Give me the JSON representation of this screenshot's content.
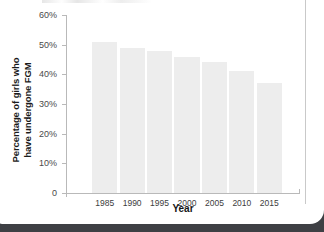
{
  "figure": {
    "card_background": "#ffffff",
    "page_background": "#3e4044",
    "bar_color": "#ededed",
    "axis_color": "#b9b9b9",
    "text_color": "#1b1b1b"
  },
  "chart_data": {
    "type": "bar",
    "title": "",
    "subtitle": "",
    "xlabel": "Year",
    "ylabel": "Percentage of girls who have undergone FGM",
    "ylabel_lines": [
      "Percentage of girls who",
      "have undergone FGM"
    ],
    "categories": [
      "1985",
      "1990",
      "1995",
      "2000",
      "2005",
      "2010",
      "2015"
    ],
    "values": [
      51,
      49,
      48,
      46,
      44,
      41,
      37
    ],
    "ylim": [
      0,
      60
    ],
    "ytick_values": [
      0,
      10,
      20,
      30,
      40,
      50,
      60
    ],
    "ytick_labels": [
      "0",
      "10%",
      "20%",
      "30%",
      "40%",
      "50%",
      "60%"
    ],
    "grid": false,
    "legend": null,
    "legend_position": "none",
    "annotations": []
  }
}
